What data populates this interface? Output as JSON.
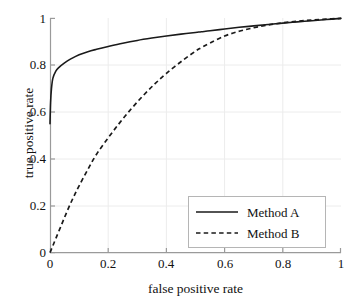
{
  "chart_data": {
    "type": "line",
    "title": "",
    "xlabel": "false positive rate",
    "ylabel": "true  positive rate",
    "xlim": [
      0,
      1
    ],
    "ylim": [
      0,
      1
    ],
    "xticks": [
      "0",
      "0.2",
      "0.4",
      "0.6",
      "0.8",
      "1"
    ],
    "xtick_values": [
      0,
      0.2,
      0.4,
      0.6,
      0.8,
      1
    ],
    "yticks": [
      "0",
      "0.2",
      "0.4",
      "0.6",
      "0.8",
      "1"
    ],
    "ytick_values": [
      0,
      0.2,
      0.4,
      0.6,
      0.8,
      1
    ],
    "grid": true,
    "legend_position": "lower right",
    "series": [
      {
        "name": "Method A",
        "style": "solid",
        "color": "#1a1a1a",
        "x": [
          0,
          0.002,
          0.005,
          0.01,
          0.02,
          0.03,
          0.05,
          0.07,
          0.1,
          0.13,
          0.16,
          0.2,
          0.25,
          0.3,
          0.35,
          0.4,
          0.45,
          0.5,
          0.52,
          0.55,
          0.6,
          0.65,
          0.7,
          0.75,
          0.8,
          0.85,
          0.9,
          0.95,
          1
        ],
        "y": [
          0.55,
          0.64,
          0.7,
          0.745,
          0.775,
          0.79,
          0.81,
          0.826,
          0.845,
          0.858,
          0.868,
          0.88,
          0.894,
          0.906,
          0.916,
          0.925,
          0.933,
          0.94,
          0.943,
          0.947,
          0.955,
          0.962,
          0.968,
          0.974,
          0.98,
          0.985,
          0.99,
          0.995,
          1
        ]
      },
      {
        "name": "Method B",
        "style": "dashed",
        "color": "#1a1a1a",
        "x": [
          0,
          0.01,
          0.02,
          0.04,
          0.06,
          0.08,
          0.1,
          0.13,
          0.16,
          0.2,
          0.24,
          0.28,
          0.32,
          0.36,
          0.4,
          0.45,
          0.5,
          0.52,
          0.55,
          0.6,
          0.65,
          0.7,
          0.75,
          0.8,
          0.85,
          0.9,
          0.95,
          1
        ],
        "y": [
          0.0,
          0.03,
          0.06,
          0.12,
          0.18,
          0.235,
          0.285,
          0.355,
          0.42,
          0.49,
          0.555,
          0.615,
          0.67,
          0.72,
          0.765,
          0.815,
          0.86,
          0.875,
          0.895,
          0.925,
          0.945,
          0.96,
          0.972,
          0.981,
          0.988,
          0.993,
          0.997,
          1
        ]
      }
    ],
    "legend": [
      {
        "label": "Method  A",
        "style": "solid"
      },
      {
        "label": "Method  B",
        "style": "dashed"
      }
    ]
  },
  "axes": {
    "x_tick_labels": [
      "0",
      "0.2",
      "0.4",
      "0.6",
      "0.8",
      "1"
    ],
    "y_tick_labels": [
      "0",
      "0.2",
      "0.4",
      "0.6",
      "0.8",
      "1"
    ],
    "x_axis_title": "false positive rate",
    "y_axis_title": "true  positive rate"
  },
  "legend": {
    "entry_a_label": "Method  A",
    "entry_b_label": "Method  B"
  },
  "style": {
    "line_color": "#1a1a1a",
    "axis_color": "#9a9a9a",
    "grid_color": "#ececec",
    "legend_border_color": "#b5b5b5",
    "background": "#ffffff"
  }
}
